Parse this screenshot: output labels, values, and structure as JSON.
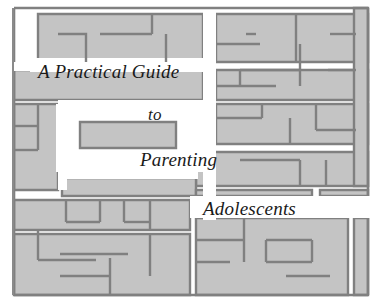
{
  "cover": {
    "kind": "book-cover-maze-illustration",
    "background_color": "#ffffff",
    "maze": {
      "wall_fill_color": "#c4c4c4",
      "wall_outline_color": "#808080",
      "path_color": "#ffffff",
      "border_color": "#808080",
      "frame": {
        "x": 14,
        "y": 8,
        "width": 355,
        "height": 287
      }
    },
    "title": {
      "full_text": "A Practical Guide to Parenting Adolescents",
      "lines": [
        {
          "text": "A Practical Guide"
        },
        {
          "text": "to"
        },
        {
          "text": "Parenting"
        },
        {
          "text": "Adolescents"
        }
      ]
    }
  }
}
